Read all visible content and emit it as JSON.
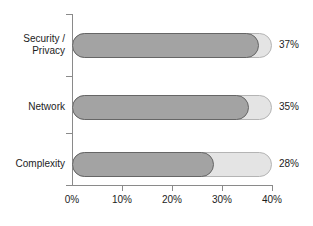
{
  "chart_data": {
    "type": "bar",
    "orientation": "horizontal",
    "title": "",
    "subtitle": "",
    "xlabel": "",
    "ylabel": "",
    "categories": [
      "Security / Privacy",
      "Network",
      "Complexity"
    ],
    "values": [
      37,
      35,
      28
    ],
    "value_labels": [
      "37%",
      "35%",
      "28%"
    ],
    "xlim": [
      0,
      40
    ],
    "xticks": [
      0,
      10,
      20,
      30,
      40
    ],
    "xtick_labels": [
      "0%",
      "10%",
      "20%",
      "30%",
      "40%"
    ],
    "grid": false,
    "legend": null,
    "units": "percent",
    "series": [
      {
        "name": "",
        "values": [
          37,
          35,
          28
        ]
      }
    ],
    "bars": [
      {
        "category": "Security / Privacy",
        "category_lines": [
          "Security /",
          "Privacy"
        ],
        "value": 37,
        "value_label": "37%"
      },
      {
        "category": "Network",
        "category_lines": [
          "Network"
        ],
        "value": 35,
        "value_label": "35%"
      },
      {
        "category": "Complexity",
        "category_lines": [
          "Complexity"
        ],
        "value": 28,
        "value_label": "28%"
      }
    ],
    "colors": {
      "background": "#ffffff",
      "bar_fill": "#a3a3a3",
      "bar_fill_outline": "#666666",
      "bar_track": "#e4e4e4",
      "bar_track_outline": "#b4b4b4",
      "axis": "#8a8a8a",
      "text": "#1c1c1c"
    }
  }
}
